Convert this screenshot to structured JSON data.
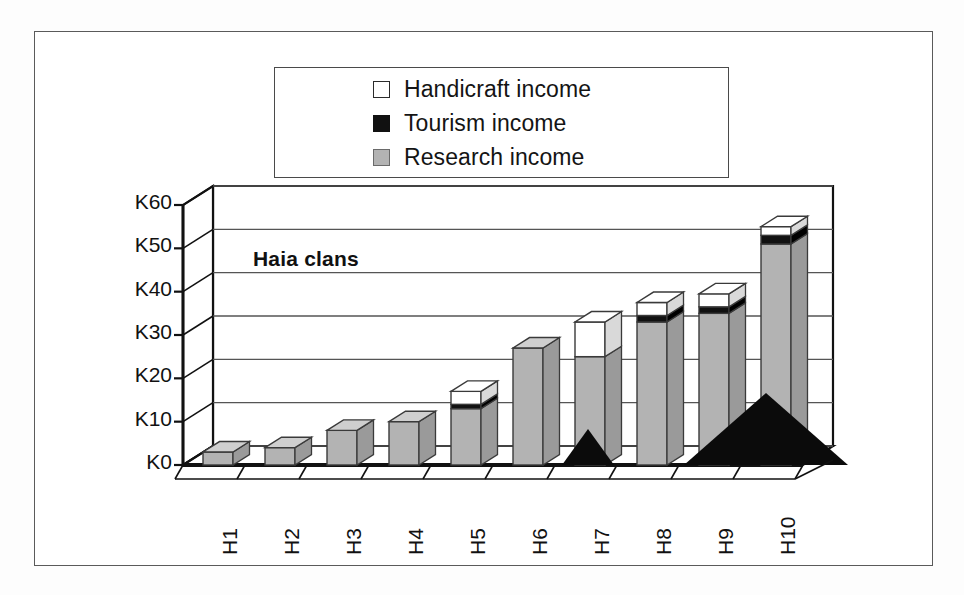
{
  "chart_data": {
    "type": "bar",
    "subtype": "stacked-3d-column",
    "title": "Haia clans",
    "xlabel": "",
    "ylabel": "",
    "categories": [
      "H1",
      "H2",
      "H3",
      "H4",
      "H5",
      "H6",
      "H7",
      "H8",
      "H9",
      "H10"
    ],
    "series": [
      {
        "name": "Research income",
        "color": "#b3b3b3",
        "values": [
          3,
          4,
          8,
          10,
          13,
          27,
          25,
          33,
          35,
          51
        ]
      },
      {
        "name": "Tourism income",
        "color": "#111111",
        "values": [
          0,
          0,
          0,
          0,
          1,
          0,
          0,
          1.5,
          1.5,
          2
        ]
      },
      {
        "name": "Handicraft income",
        "color": "#ffffff",
        "values": [
          0,
          0,
          0,
          0,
          3,
          0,
          8,
          3,
          3,
          2
        ]
      }
    ],
    "totals": [
      3,
      4,
      8,
      10,
      17,
      27,
      33,
      37.5,
      39.5,
      55
    ],
    "ylim": [
      0,
      60
    ],
    "yticks": [
      0,
      10,
      20,
      30,
      40,
      50,
      60
    ],
    "ytick_labels": [
      "K0",
      "K10",
      "K20",
      "K30",
      "K40",
      "K50",
      "K60"
    ],
    "grid": true,
    "legend_position": "top"
  },
  "legend": {
    "items": [
      {
        "label": "Handicraft income",
        "swatch": "white-swatch-icon"
      },
      {
        "label": "Tourism income",
        "swatch": "black-swatch-icon"
      },
      {
        "label": "Research income",
        "swatch": "gray-swatch-icon"
      }
    ]
  },
  "colors": {
    "research": "#b3b3b3",
    "tourism": "#111111",
    "handicraft": "#ffffff",
    "axis": "#111111",
    "grid": "#555555",
    "frame": "#5a5a5a"
  }
}
